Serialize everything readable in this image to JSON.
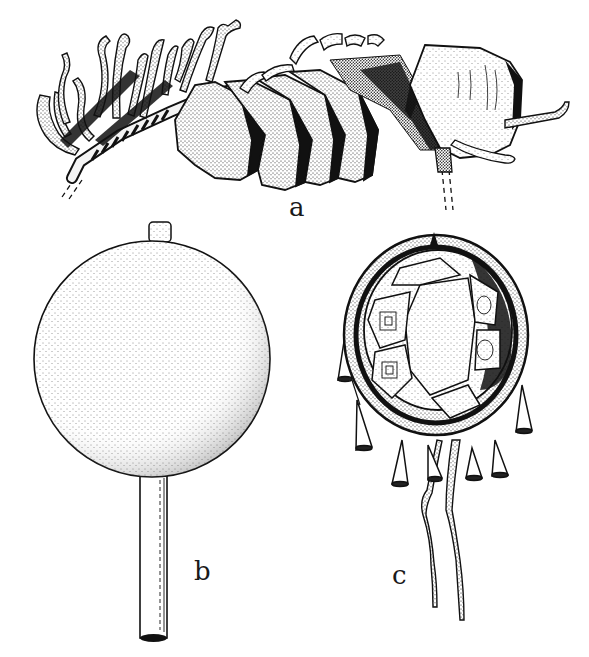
{
  "figure": {
    "type": "scientific-line-illustration",
    "style": "stippled ink drawing, black on white",
    "colors": {
      "ink": "#111111",
      "paper": "#ffffff",
      "label": "#1a1a1a"
    },
    "panels": [
      {
        "id": "a",
        "label": "a",
        "subject": "horizontal branch/stick with hanging folded hoof-like rattles and fringe of twisted strips"
      },
      {
        "id": "b",
        "label": "b",
        "subject": "round disc rattle on a cylindrical wooden handle"
      },
      {
        "id": "c",
        "label": "c",
        "subject": "turtle-shell rattle with hanging cone pendants and two long thongs"
      }
    ]
  }
}
